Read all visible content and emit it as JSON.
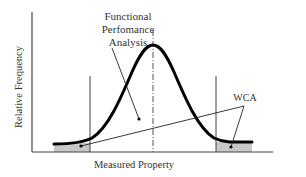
{
  "diagram": {
    "type": "normal-distribution-with-tolerance-limits",
    "annotations": {
      "fpa_line1": "Functional",
      "fpa_line2": "Perfomance",
      "fpa_line3": "Analysis",
      "wca": "WCA"
    },
    "axes": {
      "xlabel": "Measured Property",
      "ylabel": "Relative Frequency"
    },
    "colors": {
      "curve": "#000000",
      "axis": "#333333",
      "shade": "#c8c8c8",
      "text": "#333333"
    }
  }
}
